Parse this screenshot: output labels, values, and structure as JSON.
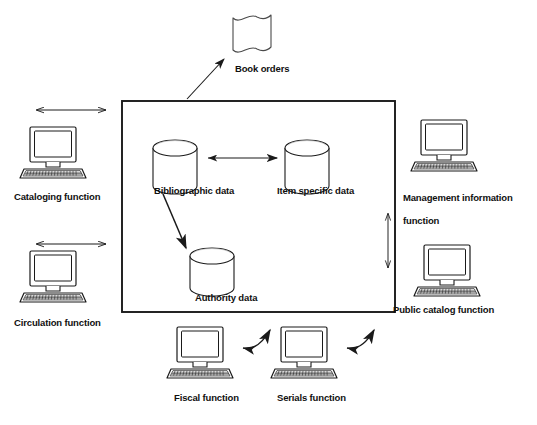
{
  "diagram": {
    "type": "block-diagram",
    "background_color": "#ffffff",
    "stroke_color": "#1a1a1a",
    "text_color": "#101010",
    "canvas": {
      "width": 537,
      "height": 425
    }
  },
  "system_boundary": {
    "name": "central-database-box",
    "x": 122,
    "y": 101,
    "width": 273,
    "height": 211
  },
  "databases": [
    {
      "id": "bibliographic",
      "label": "Bibliographic data",
      "icon": "cylinder-database-icon",
      "cx": 175,
      "cy": 148,
      "rx": 22,
      "ry": 8,
      "h": 40,
      "label_x": 155,
      "label_y": 184
    },
    {
      "id": "item-specific",
      "label": "Item specific data",
      "icon": "cylinder-database-icon",
      "cx": 307,
      "cy": 148,
      "rx": 22,
      "ry": 8,
      "h": 40,
      "label_x": 278,
      "label_y": 184
    },
    {
      "id": "authority",
      "label": "Authority data",
      "icon": "cylinder-database-icon",
      "cx": 212,
      "cy": 256,
      "rx": 22,
      "ry": 8,
      "h": 40,
      "label_x": 196,
      "label_y": 292
    }
  ],
  "artifacts": [
    {
      "id": "book-orders",
      "label": "Book orders",
      "icon": "wavy-document-icon",
      "x": 232,
      "y": 14,
      "width": 40,
      "height": 36,
      "label_x": 235,
      "label_y": 64
    }
  ],
  "functions": [
    {
      "id": "cataloging",
      "label": "Cataloging function",
      "icon": "computer-workstation-icon",
      "icon_x": 26,
      "icon_y": 127,
      "icon_w": 66,
      "icon_h": 52,
      "label_x": 14,
      "label_y": 191,
      "position": "left-top"
    },
    {
      "id": "circulation",
      "label": "Circulation function",
      "icon": "computer-workstation-icon",
      "icon_x": 26,
      "icon_y": 251,
      "icon_w": 66,
      "icon_h": 52,
      "label_x": 14,
      "label_y": 317,
      "position": "left-bottom"
    },
    {
      "id": "management-information",
      "label": "Management information\nfunction",
      "label_line1": "Management information",
      "label_line2": "function",
      "icon": "computer-workstation-icon",
      "icon_x": 417,
      "icon_y": 120,
      "icon_w": 66,
      "icon_h": 52,
      "label_x": 393,
      "label_y": 181,
      "position": "right-top"
    },
    {
      "id": "public-catalog",
      "label": "Public catalog function",
      "icon": "computer-workstation-icon",
      "icon_x": 420,
      "icon_y": 245,
      "icon_w": 66,
      "icon_h": 52,
      "label_x": 393,
      "label_y": 305,
      "position": "right-bottom"
    },
    {
      "id": "fiscal",
      "label": "Fiscal function",
      "icon": "computer-workstation-icon",
      "icon_x": 173,
      "icon_y": 327,
      "icon_w": 66,
      "icon_h": 52,
      "label_x": 174,
      "label_y": 392,
      "position": "bottom-left"
    },
    {
      "id": "serials",
      "label": "Serials function",
      "icon": "computer-workstation-icon",
      "icon_x": 277,
      "icon_y": 327,
      "icon_w": 66,
      "icon_h": 52,
      "label_x": 277,
      "label_y": 392,
      "position": "bottom-right"
    }
  ],
  "connectors": [
    {
      "id": "cataloging-to-box",
      "style": "double-arrow-horizontal",
      "x1": 35,
      "y1": 110,
      "x2": 108,
      "y2": 110
    },
    {
      "id": "circulation-to-box",
      "style": "double-arrow-horizontal",
      "x1": 35,
      "y1": 244,
      "x2": 108,
      "y2": 244
    },
    {
      "id": "box-to-book-orders",
      "style": "single-arrow-diagonal",
      "x1": 188,
      "y1": 98,
      "x2": 224,
      "y2": 58
    },
    {
      "id": "bibliographic-to-item",
      "style": "double-arrow-horizontal",
      "x1": 207,
      "y1": 158,
      "x2": 278,
      "y2": 158
    },
    {
      "id": "bibliographic-to-authority",
      "style": "single-arrow-diagonal-down",
      "x1": 166,
      "y1": 196,
      "x2": 185,
      "y2": 248
    },
    {
      "id": "management-to-public-catalog",
      "style": "double-arrow-vertical",
      "x1": 388,
      "y1": 212,
      "x2": 388,
      "y2": 270
    },
    {
      "id": "fiscal-to-box",
      "style": "curved-double-arrow",
      "x1": 243,
      "y1": 347,
      "x2": 270,
      "y2": 328
    },
    {
      "id": "serials-to-box",
      "style": "curved-double-arrow",
      "x1": 347,
      "y1": 347,
      "x2": 374,
      "y2": 328
    }
  ]
}
